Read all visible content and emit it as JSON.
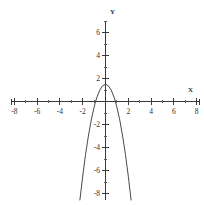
{
  "chart_data": {
    "type": "line",
    "title": "",
    "subtitle": "",
    "xlabel": "X",
    "ylabel": "Y",
    "xlim": [
      -8,
      8
    ],
    "ylim": [
      -8.6,
      7.2
    ],
    "grid": false,
    "legend": null,
    "equation": "y = -2x^2 + 1.5",
    "vertex": [
      0,
      1.5
    ],
    "x_intercepts": [
      -0.87,
      0.87
    ],
    "y_intercept": 1.5,
    "opens": "down",
    "x_ticks_major": [
      -8,
      -6,
      -4,
      -2,
      2,
      4,
      6,
      8
    ],
    "x_tick_labels": [
      "-8",
      "-6",
      "-4",
      "-2",
      "2",
      "4",
      "6",
      "8"
    ],
    "x_ticks_minor": [
      -7,
      -5,
      -3,
      -1,
      1,
      3,
      5,
      7
    ],
    "y_ticks_major": [
      6,
      4,
      2,
      -2,
      -4,
      -6,
      -8
    ],
    "y_tick_labels": [
      "6",
      "4",
      "2",
      "-2",
      "-4",
      "-6",
      "-8"
    ],
    "y_ticks_minor": [
      7,
      5,
      3,
      1,
      -1,
      -3,
      -5,
      -7
    ],
    "series": [
      {
        "name": "parabola",
        "color": "#4a4a4a",
        "x": [
          -2.25,
          -2.0,
          -1.75,
          -1.5,
          -1.25,
          -1.0,
          -0.87,
          -0.75,
          -0.5,
          -0.25,
          0,
          0.25,
          0.5,
          0.75,
          0.87,
          1.0,
          1.25,
          1.5,
          1.75,
          2.0,
          2.25
        ],
        "values": [
          -8.6,
          -6.5,
          -4.6,
          -3.0,
          -1.6,
          -0.5,
          0,
          0.37,
          1.0,
          1.37,
          1.5,
          1.37,
          1.0,
          0.37,
          0,
          -0.5,
          -1.6,
          -3.0,
          -4.6,
          -6.5,
          -8.6
        ]
      }
    ]
  },
  "axis_labels": {
    "x": "X",
    "y": "Y"
  }
}
